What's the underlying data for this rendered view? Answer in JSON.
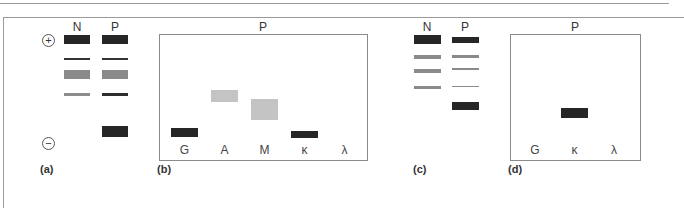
{
  "figure": {
    "panels": {
      "a": {
        "label": "(a)",
        "lanes": [
          "N",
          "P"
        ],
        "poles": {
          "anode": "+",
          "cathode": "−"
        },
        "bands": {
          "N": [
            {
              "top": 35,
              "height": 9,
              "color": "#262626"
            },
            {
              "top": 58,
              "height": 2,
              "color": "#333333"
            },
            {
              "top": 70,
              "height": 9,
              "color": "#8a8a8a"
            },
            {
              "top": 93,
              "height": 3,
              "color": "#8c8c8c"
            }
          ],
          "P": [
            {
              "top": 35,
              "height": 9,
              "color": "#262626"
            },
            {
              "top": 58,
              "height": 2,
              "color": "#333333"
            },
            {
              "top": 70,
              "height": 9,
              "color": "#8a8a8a"
            },
            {
              "top": 93,
              "height": 3,
              "color": "#2e2e2e"
            },
            {
              "top": 126,
              "height": 11,
              "color": "#262626"
            }
          ]
        }
      },
      "b": {
        "label": "(b)",
        "title": "P",
        "antisera": [
          "G",
          "A",
          "M",
          "κ",
          "λ"
        ],
        "bands": [
          {
            "antiserum": "G",
            "top": 128,
            "height": 9,
            "color": "#262626"
          },
          {
            "antiserum": "A",
            "top": 90,
            "height": 12,
            "color": "#c4c4c4"
          },
          {
            "antiserum": "M",
            "top": 99,
            "height": 21,
            "color": "#c4c4c4"
          },
          {
            "antiserum": "κ",
            "top": 131,
            "height": 7,
            "color": "#262626"
          }
        ]
      },
      "c": {
        "label": "(c)",
        "lanes": [
          "N",
          "P"
        ],
        "bands": {
          "N": [
            {
              "top": 35,
              "height": 9,
              "color": "#262626"
            },
            {
              "top": 55,
              "height": 4,
              "color": "#8a8a8a"
            },
            {
              "top": 69,
              "height": 4,
              "color": "#8a8a8a"
            },
            {
              "top": 86,
              "height": 3,
              "color": "#8a8a8a"
            }
          ],
          "P": [
            {
              "top": 37,
              "height": 6,
              "color": "#262626"
            },
            {
              "top": 55,
              "height": 3,
              "color": "#8a8a8a"
            },
            {
              "top": 68,
              "height": 2,
              "color": "#8a8a8a"
            },
            {
              "top": 86,
              "height": 1,
              "color": "#8a8a8a"
            },
            {
              "top": 102,
              "height": 8,
              "color": "#262626"
            }
          ]
        }
      },
      "d": {
        "label": "(d)",
        "title": "P",
        "antisera": [
          "G",
          "κ",
          "λ"
        ],
        "bands": [
          {
            "antiserum": "κ",
            "top": 108,
            "height": 10,
            "color": "#262626"
          }
        ]
      }
    }
  }
}
